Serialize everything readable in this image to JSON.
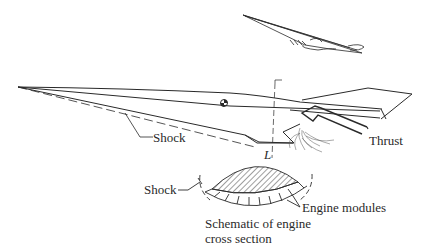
{
  "figure": {
    "colors": {
      "ink": "#2a2a2a",
      "background": "#ffffff"
    }
  },
  "labels": {
    "shock_main": "Shock",
    "thrust": "Thrust",
    "lift": "L",
    "shock_cross_section": "Shock",
    "engine_modules": "Engine modules",
    "caption_line1": "Schematic of engine",
    "caption_line2": "cross section"
  }
}
